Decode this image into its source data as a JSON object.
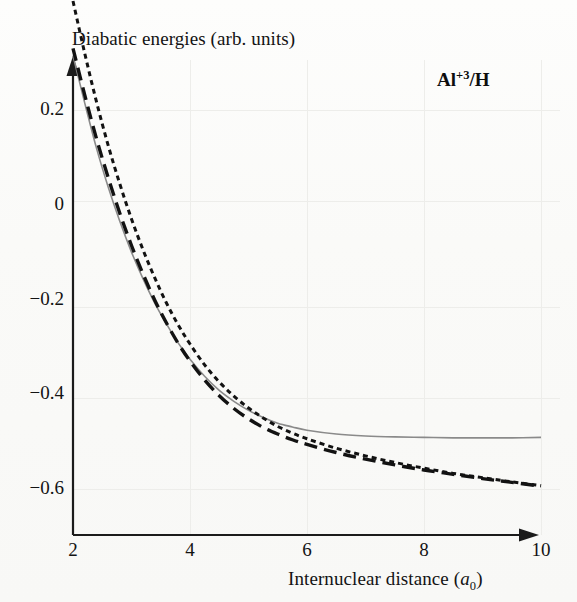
{
  "chart_data": {
    "type": "line",
    "title": "Diabatic energies (arb. units)",
    "xlabel": "Internuclear distance (a0)",
    "ylabel": "Diabatic energies (arb. units)",
    "annotation": "Al+3/H",
    "annotation_parts": {
      "element": "Al",
      "charge": "+3",
      "partner": "/H"
    },
    "xlim": [
      2,
      10
    ],
    "ylim": [
      -0.68,
      0.33
    ],
    "xticks": [
      2,
      4,
      6,
      8,
      10
    ],
    "yticks": [
      0.2,
      0,
      -0.2,
      -0.4,
      -0.6
    ],
    "xticklabels": [
      "2",
      "4",
      "6",
      "8",
      "10"
    ],
    "yticklabels": [
      "0.2",
      "0",
      "−0.2",
      "−0.4",
      "−0.6"
    ],
    "grid": "faint",
    "legend": "none",
    "x": [
      2.0,
      2.2,
      2.4,
      2.6,
      2.8,
      3.0,
      3.2,
      3.4,
      3.6,
      3.8,
      4.0,
      4.25,
      4.5,
      4.75,
      5.0,
      5.25,
      5.5,
      5.75,
      6.0,
      6.5,
      7.0,
      7.5,
      8.0,
      8.5,
      9.0,
      9.5,
      10.0
    ],
    "series": [
      {
        "name": "solid-gray-curve",
        "style": "solid",
        "color": "#8a8a8a",
        "width": 1.6,
        "values": [
          0.315,
          0.215,
          0.12,
          0.038,
          -0.035,
          -0.1,
          -0.157,
          -0.208,
          -0.252,
          -0.292,
          -0.326,
          -0.362,
          -0.392,
          -0.415,
          -0.434,
          -0.449,
          -0.461,
          -0.469,
          -0.476,
          -0.484,
          -0.488,
          -0.49,
          -0.491,
          -0.492,
          -0.492,
          -0.492,
          -0.491
        ]
      },
      {
        "name": "long-dashed-black-curve",
        "style": "long-dash",
        "color": "#121212",
        "width": 3.4,
        "dasharray": "13,7",
        "values": [
          0.33,
          0.232,
          0.14,
          0.058,
          -0.018,
          -0.086,
          -0.147,
          -0.202,
          -0.25,
          -0.293,
          -0.33,
          -0.37,
          -0.403,
          -0.43,
          -0.452,
          -0.47,
          -0.484,
          -0.496,
          -0.506,
          -0.523,
          -0.537,
          -0.549,
          -0.56,
          -0.569,
          -0.578,
          -0.586,
          -0.594
        ]
      },
      {
        "name": "short-dotted-black-curve",
        "style": "short-dash",
        "color": "#121212",
        "width": 3.0,
        "dasharray": "5,4",
        "values": [
          0.43,
          0.32,
          0.218,
          0.126,
          0.044,
          -0.03,
          -0.096,
          -0.155,
          -0.208,
          -0.254,
          -0.294,
          -0.338,
          -0.374,
          -0.404,
          -0.429,
          -0.45,
          -0.468,
          -0.482,
          -0.494,
          -0.514,
          -0.53,
          -0.544,
          -0.556,
          -0.567,
          -0.576,
          -0.585,
          -0.593
        ]
      }
    ]
  },
  "axes": {
    "y_title": "Diabatic energies (arb. units)",
    "x_title_prefix": "Internuclear distance (",
    "x_title_symbol": "a",
    "x_title_sub": "0",
    "x_title_suffix": ")"
  }
}
